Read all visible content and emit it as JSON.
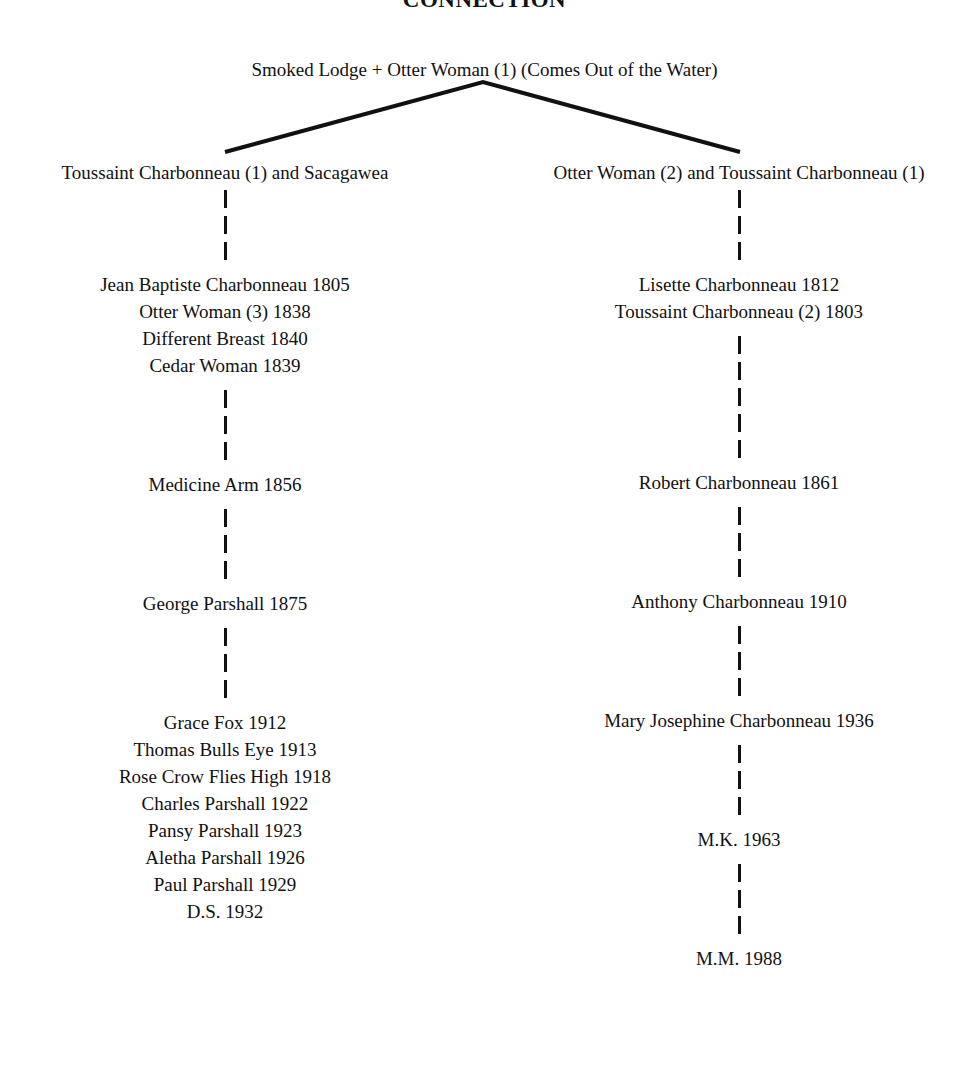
{
  "title": "CONNECTION",
  "root": {
    "label": "Smoked Lodge + Otter Woman (1) (Comes Out of the Water)"
  },
  "branches": {
    "left": {
      "heading": "Toussaint Charbonneau (1) and Sacagawea",
      "generations": [
        {
          "stems_before": 3,
          "entries": [
            "Jean Baptiste Charbonneau 1805",
            "Otter Woman (3) 1838",
            "Different Breast 1840",
            "Cedar Woman 1839"
          ]
        },
        {
          "stems_before": 3,
          "entries": [
            "Medicine Arm 1856"
          ]
        },
        {
          "stems_before": 3,
          "entries": [
            "George Parshall 1875"
          ]
        },
        {
          "stems_before": 3,
          "entries": [
            "Grace Fox 1912",
            "Thomas Bulls Eye 1913",
            "Rose Crow Flies High 1918",
            "Charles Parshall 1922",
            "Pansy Parshall 1923",
            "Aletha Parshall 1926",
            "Paul Parshall 1929",
            "D.S. 1932"
          ]
        }
      ]
    },
    "right": {
      "heading": "Otter Woman (2) and Toussaint Charbonneau (1)",
      "generations": [
        {
          "stems_before": 3,
          "entries": [
            "Lisette Charbonneau 1812",
            "Toussaint Charbonneau (2) 1803"
          ]
        },
        {
          "stems_before": 5,
          "entries": [
            "Robert Charbonneau 1861"
          ]
        },
        {
          "stems_before": 3,
          "entries": [
            "Anthony Charbonneau 1910"
          ]
        },
        {
          "stems_before": 3,
          "entries": [
            "Mary Josephine Charbonneau 1936"
          ]
        },
        {
          "stems_before": 3,
          "entries": [
            "M.K. 1963"
          ]
        },
        {
          "stems_before": 3,
          "entries": [
            "M.M. 1988"
          ]
        }
      ]
    }
  },
  "colors": {
    "ink": "#111111",
    "page": "#ffffff"
  }
}
